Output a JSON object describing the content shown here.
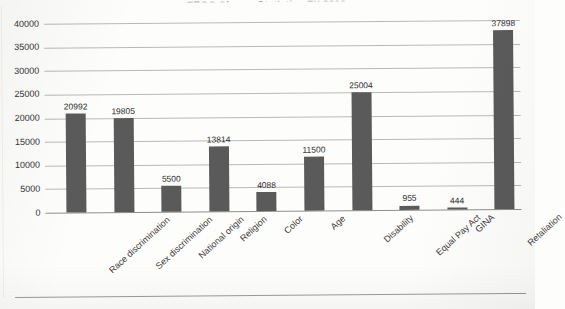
{
  "document": {
    "title_partial": "EEOC Charge Statistics FY 2012",
    "bottom_rule": true
  },
  "chart_data": {
    "type": "bar",
    "title": "EEOC Charge Statistics FY 2012",
    "xlabel": "",
    "ylabel": "",
    "categories": [
      "Race discrimination",
      "Sex discrimination",
      "National origin",
      "Religion",
      "Color",
      "Age",
      "Disability",
      "Equal Pay Act",
      "GINA",
      "Retaliation"
    ],
    "values": [
      20992,
      19805,
      5500,
      13814,
      4088,
      11500,
      25004,
      955,
      444,
      37898
    ],
    "value_labels": [
      "20992",
      "19805",
      "5500",
      "13814",
      "4088",
      "11500",
      "25004",
      "955",
      "444",
      "37898"
    ],
    "ylim": [
      0,
      40000
    ],
    "ytick_step": 5000,
    "yticks": [
      "40000",
      "35000",
      "30000",
      "25000",
      "20000",
      "15000",
      "10000",
      "5000",
      "0"
    ],
    "ytick_values": [
      40000,
      35000,
      30000,
      25000,
      20000,
      15000,
      10000,
      5000,
      0
    ],
    "grid": true,
    "legend": false,
    "legend_position": "none",
    "bar_color": "#5a5a5a",
    "gridline_color": "#b9b9b9",
    "axis_color": "#8d8d8d",
    "background_color": "#fdfdfc",
    "label_rotation_degrees": -42
  }
}
